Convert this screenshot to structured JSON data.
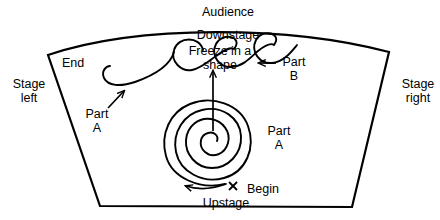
{
  "diagram": {
    "stage_outline": {
      "shape": "trapezoid-with-curved-downstage-edge",
      "color": "#000000"
    },
    "labels": {
      "audience": "Audience",
      "downstage": "Downstage",
      "upstage": "Upstage",
      "stage_left": "Stage\nleft",
      "stage_right": "Stage\nright",
      "end": "End",
      "begin": "Begin",
      "freeze_in_a_shape": "Freeze in a\nshape",
      "part_a_loops": "Part\nA",
      "part_a_spiral": "Part\nA",
      "part_b": "Part\nB"
    },
    "marks": {
      "begin_marker": "x",
      "spiral_turns": 4,
      "loop_count": 3
    },
    "arrows": {
      "part_a_loops_pointer": "arrow-up-right",
      "part_b_pointer": "arrow-left",
      "freeze_pointer": "arrow-up",
      "spiral_direction": "arrow-left",
      "end_pointer": "curve-hook"
    },
    "colors": {
      "ink": "#000000",
      "background": "#ffffff"
    }
  }
}
